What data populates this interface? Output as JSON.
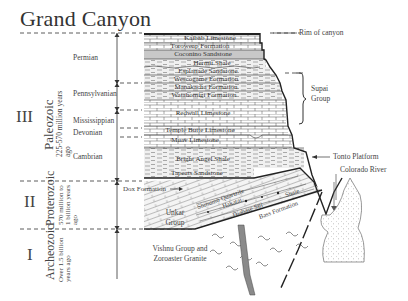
{
  "title": "Grand Canyon",
  "eras": [
    {
      "numeral": "III",
      "name": "Paleozoic",
      "age": "225-570 million years ago"
    },
    {
      "numeral": "II",
      "name": "Proterozoic",
      "age": "570 million to 1 billion years ago"
    },
    {
      "numeral": "I",
      "name": "Archeozoic",
      "age": "Over 1.5 billion years ago"
    }
  ],
  "periods": [
    "Permian",
    "Pennsylvanian",
    "Mississippian",
    "Devonian",
    "Cambrian"
  ],
  "layers": [
    "Kaibab Limestone",
    "Toroweap Formation",
    "Coconino Sandstone",
    "Hermit Shale",
    "Esplanade Sandstone",
    "Wescogame Formation",
    "Manakacha Formation",
    "Watahomigi Formation",
    "Redwall Limestone",
    "Temple Butte Limestone",
    "Muav Limestone",
    "Bright Angel Shale",
    "Tapeats Sandstone"
  ],
  "unkar": {
    "group_label": "Unkar Group",
    "layers": [
      "Shinumo Quartzite",
      "Hakatai",
      "Diabase Sill",
      "Shale",
      "Bass Formation"
    ],
    "dox": "Dox Formation"
  },
  "basement": "Vishnu Group and Zoroaster Granite",
  "annotations": {
    "rim": "Rim of canyon",
    "supai": "Supai Group",
    "tonto": "Tonto Platform",
    "river": "Colorado River"
  },
  "colors": {
    "ink": "#222222",
    "coconino": "#c8c8c8",
    "shale_fill": "#e6e6e6",
    "dike": "#8a8a8a"
  }
}
